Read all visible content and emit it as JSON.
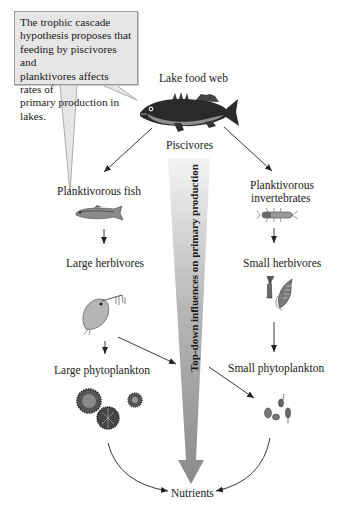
{
  "callout": {
    "text_lines": [
      "The trophic cascade",
      "hypothesis proposes that",
      "feeding by piscivores and",
      "planktivores affects rates of",
      "primary production in lakes."
    ]
  },
  "title": "Lake food web",
  "nodes": {
    "piscivores": "Piscivores",
    "planktivorous_fish": "Planktivorous fish",
    "planktivorous_invertebrates_line1": "Planktivorous",
    "planktivorous_invertebrates_line2": "invertebrates",
    "large_herbivores": "Large herbivores",
    "small_herbivores": "Small herbivores",
    "large_phytoplankton": "Large phytoplankton",
    "small_phytoplankton": "Small phytoplankton",
    "nutrients": "Nutrients"
  },
  "central_arrow": {
    "label": "Top-down influences on primary production",
    "color_top": "#f2f2f2",
    "color_bottom": "#8a8a8a"
  },
  "icons": [
    "largemouth-bass-icon",
    "small-planktivorous-fish-icon",
    "insect-larva-icon",
    "daphnia-icon",
    "copepod-icon",
    "large-phytoplankton-colony-icon",
    "small-phytoplankton-cells-icon"
  ]
}
